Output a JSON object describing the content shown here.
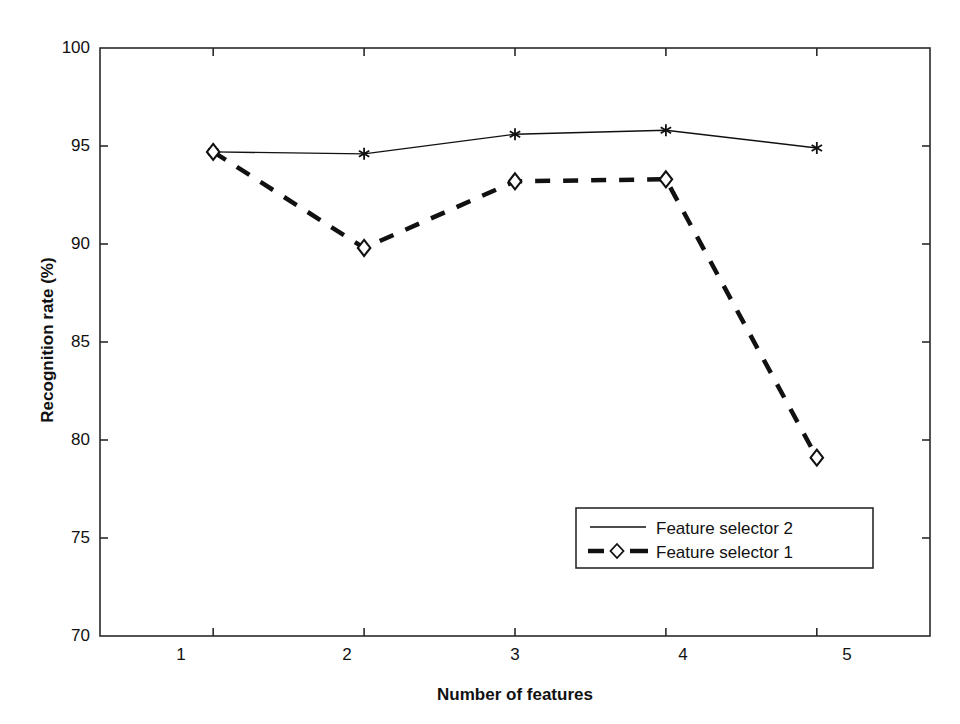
{
  "chart_data": {
    "type": "line",
    "title": "",
    "xlabel": "Number of features",
    "ylabel": "Recognition rate (%)",
    "x": [
      1,
      2,
      3,
      4,
      5
    ],
    "xticklabels": [
      "1",
      "2",
      "3",
      "4",
      "5"
    ],
    "yticklabels": [
      "70",
      "75",
      "80",
      "85",
      "90",
      "95",
      "100"
    ],
    "yticks": [
      70,
      75,
      80,
      85,
      90,
      95,
      100
    ],
    "xlim": [
      0.25,
      5.75
    ],
    "ylim": [
      70,
      100
    ],
    "grid": false,
    "legend_position": "lower right",
    "series": [
      {
        "name": "Feature selector 2",
        "values": [
          94.7,
          94.6,
          95.6,
          95.8,
          94.9
        ],
        "linestyle": "solid",
        "marker": "asterisk",
        "color": "#111111",
        "linewidth": 1.4
      },
      {
        "name": "Feature selector 1",
        "values": [
          94.7,
          89.8,
          93.2,
          93.3,
          79.1
        ],
        "linestyle": "dashed",
        "marker": "diamond-open",
        "color": "#111111",
        "linewidth": 4.5
      }
    ]
  },
  "legend": {
    "entries": [
      {
        "label": "Feature selector 2",
        "style": "solid-line"
      },
      {
        "label": "Feature selector 1",
        "style": "dashed-line-diamond"
      }
    ]
  },
  "axes": {
    "y_title": "Recognition rate (%)",
    "x_title": "Number of features",
    "ytick_labels": [
      "100",
      "95",
      "90",
      "85",
      "80",
      "75",
      "70"
    ],
    "xtick_labels": [
      "1",
      "2",
      "3",
      "4",
      "5"
    ]
  },
  "colors": {
    "background": "#ffffff",
    "ink": "#111111",
    "axis": "#2a2a2a"
  }
}
